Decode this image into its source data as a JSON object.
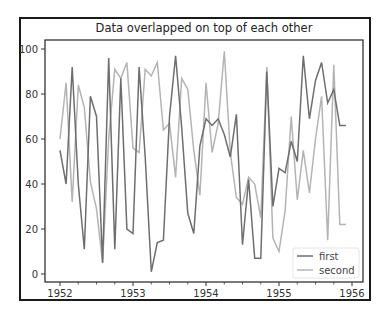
{
  "chart_data": {
    "type": "line",
    "title": "Data overlapped on top of each other",
    "xlabel": "",
    "ylabel": "",
    "xlim": [
      1951.83,
      1956.08
    ],
    "ylim": [
      -3,
      104
    ],
    "x_ticks": [
      "1952",
      "1953",
      "1954",
      "1955",
      "1956"
    ],
    "y_ticks": [
      "0",
      "20",
      "40",
      "60",
      "80",
      "100"
    ],
    "grid": false,
    "legend_position": "lower right",
    "x_start": "1952-01",
    "x_frequency": "monthly",
    "series": [
      {
        "name": "first",
        "color": "#6e6e6e",
        "values": [
          55,
          40,
          92,
          40,
          11,
          79,
          70,
          5,
          96,
          11,
          87,
          20,
          18,
          92,
          52,
          1,
          14,
          15,
          70,
          97,
          65,
          27,
          18,
          57,
          69,
          66,
          69,
          62,
          52,
          71,
          13,
          42,
          7,
          7,
          90,
          30,
          47,
          45,
          59,
          50,
          97,
          69,
          86,
          94,
          76,
          82,
          66,
          66
        ]
      },
      {
        "name": "second",
        "color": "#b4b4b4",
        "values": [
          60,
          85,
          32,
          84,
          74,
          41,
          29,
          5,
          60,
          91,
          87,
          94,
          56,
          54,
          91,
          88,
          94,
          64,
          67,
          43,
          87,
          82,
          55,
          35,
          85,
          54,
          67,
          99,
          54,
          34,
          31,
          43,
          40,
          25,
          92,
          16,
          10,
          28,
          70,
          33,
          55,
          36,
          60,
          79,
          15,
          93,
          22,
          22
        ]
      }
    ]
  },
  "legend": {
    "items": [
      {
        "label": "first",
        "color": "#6e6e6e"
      },
      {
        "label": "second",
        "color": "#b4b4b4"
      }
    ]
  }
}
